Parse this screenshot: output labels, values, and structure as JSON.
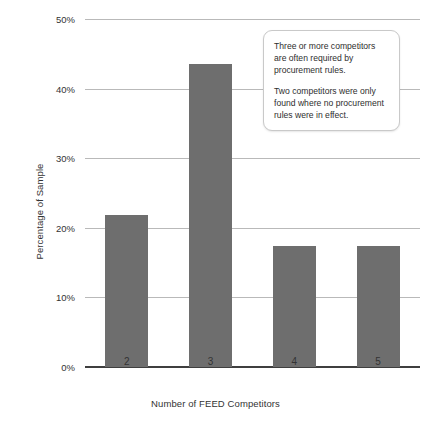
{
  "chart_data": {
    "type": "bar",
    "title": "",
    "subtitle": "",
    "xlabel": "Number of FEED Competitors",
    "ylabel": "Percentage of Sample",
    "categories": [
      "2",
      "3",
      "4",
      "5"
    ],
    "values": [
      21.8,
      43.5,
      17.4,
      17.4
    ],
    "value_format": "percent",
    "ylim": [
      0,
      50
    ],
    "y_ticks": [
      0,
      10,
      20,
      30,
      40,
      50
    ],
    "y_tick_labels": [
      "0%",
      "10%",
      "20%",
      "30%",
      "40%",
      "50%"
    ],
    "grid": "horizontal",
    "legend": "none",
    "bar_color": "#6e6e6e",
    "gridline_color": "#b9b9b9",
    "axis_color": "#3f3f3f",
    "background_color": "#ffffff",
    "annotations": [
      {
        "id": "callout",
        "position": "upper-right",
        "paragraphs": [
          "Three or more competitors are often required by procurement rules.",
          "Two competitors were only found where no procurement rules were in effect."
        ]
      }
    ]
  }
}
